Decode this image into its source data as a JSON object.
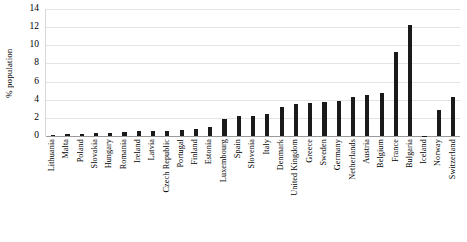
{
  "chart_data": {
    "type": "bar",
    "title": "",
    "xlabel": "",
    "ylabel": "% population",
    "ylim": [
      0,
      14
    ],
    "yticks": [
      0,
      2,
      4,
      6,
      8,
      10,
      12,
      14
    ],
    "grid": true,
    "legend": null,
    "orientation": "vertical",
    "bar_color": "#1a1a1a",
    "categories": [
      "Lithuania",
      "Malta",
      "Poland",
      "Slovakia",
      "Hungary",
      "Romania",
      "Ireland",
      "Latvia",
      "Czech Republic",
      "Portugal",
      "Finland",
      "Estonia",
      "Luxembourg",
      "Spain",
      "Slovenia",
      "Italy",
      "Denmark",
      "United Kingdom",
      "Greece",
      "Sweden",
      "Germany",
      "Netherlands",
      "Austria",
      "Belgium",
      "France",
      "Bulgaria",
      "Iceland",
      "Norway",
      "Switzerland"
    ],
    "values": [
      0.15,
      0.2,
      0.25,
      0.3,
      0.35,
      0.4,
      0.5,
      0.55,
      0.6,
      0.7,
      0.8,
      0.95,
      1.9,
      2.2,
      2.25,
      2.4,
      3.2,
      3.5,
      3.6,
      3.75,
      3.85,
      4.3,
      4.5,
      4.7,
      9.3,
      12.2,
      0.05,
      2.85,
      4.35
    ]
  }
}
